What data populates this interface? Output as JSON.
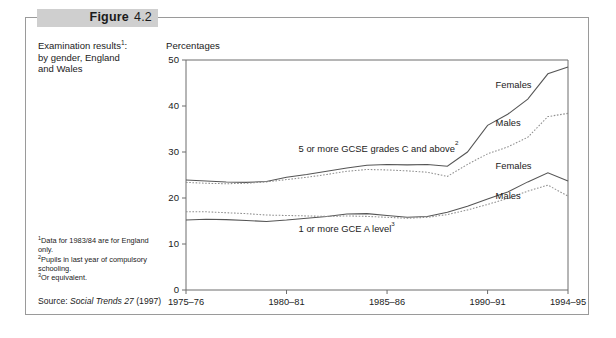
{
  "figure": {
    "label": "Figure",
    "number": "4.2"
  },
  "caption": {
    "line1": "Examination results",
    "line1_sup": "1",
    "line1_tail": ":",
    "line2": "by gender, England",
    "line3": "and Wales"
  },
  "footnotes": [
    {
      "marker": "1",
      "text": "Data for 1983/84 are for England"
    },
    {
      "marker": "",
      "text": "only."
    },
    {
      "marker": "2",
      "text": "Pupils in last year of compulsory"
    },
    {
      "marker": "",
      "text": "schooling."
    },
    {
      "marker": "3",
      "text": "Or equivalent."
    }
  ],
  "source": {
    "prefix": "Source: ",
    "italic": "Social Trends 27",
    "suffix": " (1997)"
  },
  "chart_data": {
    "type": "line",
    "ylabel": "Percentages",
    "xlabel": "",
    "ylim": [
      0,
      50
    ],
    "yticks": [
      0,
      10,
      20,
      30,
      40,
      50
    ],
    "grid": false,
    "legend_position": "inline-right",
    "x": [
      "1975-76",
      "1976-77",
      "1977-78",
      "1978-79",
      "1979-80",
      "1980-81",
      "1981-82",
      "1982-83",
      "1983-84",
      "1984-85",
      "1985-86",
      "1986-87",
      "1987-88",
      "1988-89",
      "1989-90",
      "1990-91",
      "1991-92",
      "1992-93",
      "1993-94",
      "1994-95"
    ],
    "xtick_labels": [
      "1975–76",
      "1980–81",
      "1985–86",
      "1990–91",
      "1994–95"
    ],
    "xtick_indices": [
      0,
      5,
      10,
      15,
      19
    ],
    "annotations": [
      {
        "text": "5 or more GCSE grades C and above",
        "sup": "2",
        "x_index": 5.6,
        "y_value": 30.1
      },
      {
        "text": "1 or more GCE A level",
        "sup": "3",
        "x_index": 5.6,
        "y_value": 12.6
      }
    ],
    "series": [
      {
        "name": "Females",
        "group": "5 or more GCSE grades C and above",
        "style": "solid",
        "label_x_index": 15.4,
        "label_y_value": 44.0,
        "values": [
          23.9,
          23.7,
          23.5,
          23.4,
          23.6,
          24.5,
          25.1,
          25.8,
          26.5,
          27.1,
          27.3,
          27.2,
          27.3,
          26.9,
          30.0,
          35.8,
          38.2,
          41.5,
          47.0,
          48.5
        ]
      },
      {
        "name": "Males",
        "group": "5 or more GCSE grades C and above",
        "style": "dotted",
        "label_x_index": 15.4,
        "label_y_value": 35.7,
        "values": [
          23.4,
          23.2,
          23.1,
          23.2,
          23.5,
          24.0,
          24.5,
          25.1,
          25.8,
          26.2,
          26.1,
          25.9,
          25.6,
          24.7,
          27.3,
          29.6,
          31.1,
          33.2,
          37.7,
          38.4
        ]
      },
      {
        "name": "Females",
        "group": "1 or more GCE A level",
        "style": "solid",
        "label_x_index": 15.4,
        "label_y_value": 26.4,
        "values": [
          15.2,
          15.4,
          15.3,
          15.1,
          14.9,
          15.2,
          15.6,
          16.0,
          16.5,
          16.6,
          16.2,
          15.8,
          16.0,
          16.9,
          18.2,
          19.8,
          21.3,
          23.5,
          25.5,
          23.7
        ]
      },
      {
        "name": "Males",
        "group": "1 or more GCE A level",
        "style": "dotted",
        "label_x_index": 15.4,
        "label_y_value": 19.8,
        "values": [
          17.0,
          17.0,
          16.8,
          16.6,
          16.3,
          16.2,
          16.1,
          16.0,
          16.1,
          16.0,
          15.8,
          15.6,
          15.8,
          16.4,
          17.4,
          18.6,
          19.9,
          21.5,
          22.8,
          20.4
        ]
      }
    ]
  },
  "colors": {
    "band": "#cfcfcf",
    "frame": "#9a9a9a",
    "axis": "#6d6d6d",
    "solid_line": "#555555",
    "dotted_line": "#8f8f8f",
    "text": "#1b1b1b"
  }
}
